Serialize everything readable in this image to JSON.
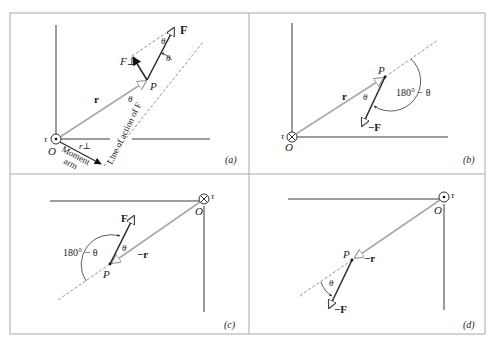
{
  "figure": {
    "panels": [
      {
        "id": "a",
        "caption": "(a)",
        "labels": {
          "force": "F",
          "force_perp": "F⊥",
          "theta_top": "θ",
          "theta_side": "θ",
          "point": "P",
          "position": "r",
          "theta_at_r": "θ",
          "line_of_action": "Line of action of F",
          "torque": "τ",
          "origin": "O",
          "r_perp": "r⊥",
          "moment_arm_1": "Moment",
          "moment_arm_2": "arm"
        },
        "torque_symbol": "dot-out-of-page"
      },
      {
        "id": "b",
        "caption": "(b)",
        "labels": {
          "point": "P",
          "position": "r",
          "theta": "θ",
          "angle": "180° − θ",
          "force": "−F",
          "torque": "τ",
          "origin": "O"
        },
        "torque_symbol": "cross-into-page"
      },
      {
        "id": "c",
        "caption": "(c)",
        "labels": {
          "force": "F",
          "theta": "θ",
          "angle": "180° − θ",
          "position": "−r",
          "point": "P",
          "torque": "τ",
          "origin": "O"
        },
        "torque_symbol": "cross-into-page"
      },
      {
        "id": "d",
        "caption": "(d)",
        "labels": {
          "point": "P",
          "position": "−r",
          "theta": "θ",
          "force": "−F",
          "torque": "τ",
          "origin": "O"
        },
        "torque_symbol": "dot-out-of-page"
      }
    ],
    "colors": {
      "frame": "#a8a8a8",
      "axis": "#3a3a3a",
      "position_vector": "#a9a9a9",
      "force_vector": "#2a2a2a",
      "dashed": "#777777",
      "text": "#222222"
    }
  }
}
